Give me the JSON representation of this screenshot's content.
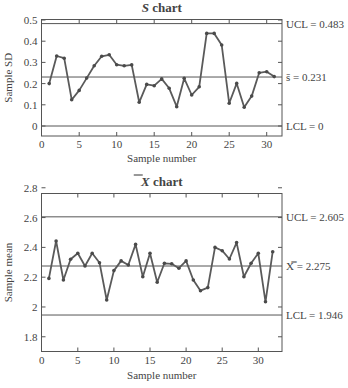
{
  "chart_data": [
    {
      "type": "line",
      "title": "S chart",
      "title_italic_part": "S",
      "title_rest": " chart",
      "xlabel": "Sample number",
      "ylabel": "Sample SD",
      "xlim": [
        0,
        32
      ],
      "ylim": [
        -0.05,
        0.5
      ],
      "xticks": [
        0,
        5,
        10,
        15,
        20,
        25,
        30
      ],
      "yticks": [
        0,
        0.1,
        0.2,
        0.3,
        0.4,
        0.5
      ],
      "ytick_labels": [
        "0",
        "0.1",
        "0.2",
        "0.3",
        "0.4",
        "0.5"
      ],
      "x": [
        1,
        2,
        3,
        4,
        5,
        6,
        7,
        8,
        9,
        10,
        11,
        12,
        13,
        14,
        15,
        16,
        17,
        18,
        19,
        20,
        21,
        22,
        23,
        24,
        25,
        26,
        27,
        28,
        29,
        30,
        31
      ],
      "values": [
        0.2,
        0.33,
        0.32,
        0.124,
        0.168,
        0.226,
        0.284,
        0.329,
        0.336,
        0.289,
        0.284,
        0.288,
        0.112,
        0.196,
        0.19,
        0.222,
        0.178,
        0.091,
        0.225,
        0.146,
        0.185,
        0.437,
        0.437,
        0.382,
        0.107,
        0.201,
        0.088,
        0.141,
        0.251,
        0.256,
        0.233
      ],
      "control_lines": [
        {
          "name": "UCL",
          "value": 0.483,
          "label": "UCL = 0.483"
        },
        {
          "name": "center",
          "value": 0.231,
          "label": "s̄ = 0.231"
        },
        {
          "name": "LCL",
          "value": 0,
          "label": "LCL = 0"
        }
      ],
      "grid": false
    },
    {
      "type": "line",
      "title": "X̄ chart",
      "title_italic_part": "X",
      "title_rest": " chart",
      "xlabel": "Sample number",
      "ylabel": "Sample mean",
      "xlim": [
        0,
        33.2
      ],
      "ylim": [
        1.7,
        2.8
      ],
      "xticks": [
        0,
        5,
        10,
        15,
        20,
        25,
        30
      ],
      "yticks": [
        1.8,
        2.0,
        2.2,
        2.4,
        2.6,
        2.8
      ],
      "ytick_labels": [
        "1.8",
        "2",
        "2.2",
        "2.4",
        "2.6",
        "2.8"
      ],
      "x": [
        1,
        2,
        3,
        4,
        5,
        6,
        7,
        8,
        9,
        10,
        11,
        12,
        13,
        14,
        15,
        16,
        17,
        18,
        19,
        20,
        21,
        22,
        23,
        24,
        25,
        26,
        27,
        28,
        29,
        30,
        31,
        32
      ],
      "values": [
        2.192,
        2.443,
        2.181,
        2.32,
        2.36,
        2.275,
        2.36,
        2.297,
        2.047,
        2.244,
        2.309,
        2.282,
        2.42,
        2.203,
        2.36,
        2.166,
        2.293,
        2.29,
        2.26,
        2.309,
        2.181,
        2.109,
        2.13,
        2.4,
        2.378,
        2.322,
        2.432,
        2.203,
        2.293,
        2.36,
        2.035,
        2.371
      ],
      "control_lines": [
        {
          "name": "UCL",
          "value": 2.605,
          "label": "UCL = 2.605"
        },
        {
          "name": "center",
          "value": 2.275,
          "label": "X̿ = 2.275"
        },
        {
          "name": "LCL",
          "value": 1.946,
          "label": "LCL = 1.946"
        }
      ],
      "grid": false
    }
  ],
  "colors": {
    "line": "#5a5a5a",
    "marker": "#4a4a4a",
    "axis": "#555555",
    "text": "#444444"
  }
}
